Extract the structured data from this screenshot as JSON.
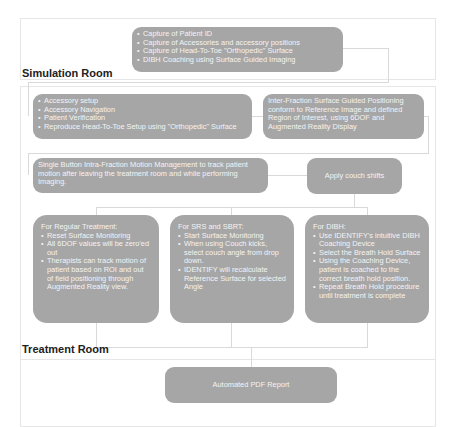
{
  "colors": {
    "node_fill": "#a6a6a6",
    "node_text": "#f4f4f4",
    "frame_border": "#e6e6e6",
    "connector": "#d9d9d9",
    "label_text": "#222222"
  },
  "simulation_room": {
    "label": "Simulation Room",
    "capture_box": {
      "items": [
        "Capture of Patient ID",
        "Capture of Accessories and accessory positions",
        "Capture of Head-To-Toe \"Orthopedic\" Surface",
        "DIBH Coaching using Surface Guided Imaging"
      ]
    }
  },
  "treatment_room": {
    "label": "Treatment Room",
    "setup_box": {
      "items": [
        "Accessory setup",
        "Accessory Navigation",
        "Patient Verification",
        "Reproduce Head-To-Toe Setup using \"Orthopedic\" Surface"
      ]
    },
    "inter_fraction_box": {
      "text": "Inter-Fraction Surface Guided Positioning conform to Reference Image and defined Region of Interest, using 6DOF and Augmented Reality Display"
    },
    "intra_fraction_box": {
      "text": "Single Button Intra-Fraction Motion Management to track patient motion after leaving the treatment room and while performing Imaging."
    },
    "couch_shifts_box": {
      "text": "Apply couch shifts"
    },
    "regular_box": {
      "heading": "For Regular Treatment:",
      "items": [
        "Reset Surface Monitoring",
        "All 6DOF values will be zero'ed out",
        "Therapists can track motion of patient based on ROI and out of field positioning through Augmented Reality view."
      ]
    },
    "srs_box": {
      "heading": "For SRS and SBRT:",
      "items": [
        "Start Surface Monitoring",
        "When using Couch kicks, select couch angle from drop down.",
        "IDENTIFY will recalculate Reference Surface for selected Angle"
      ]
    },
    "dibh_box": {
      "heading": "For DIBH:",
      "items": [
        "Use IDENTIFY's intuitive DIBH Coaching Device",
        "Select the Breath Hold Surface",
        "Using the Coaching Device, patient is coached to the correct breath hold position.",
        "Repeat Breath Hold procedure until treatment is complete"
      ]
    }
  },
  "report_box": {
    "text": "Automated PDF Report"
  }
}
